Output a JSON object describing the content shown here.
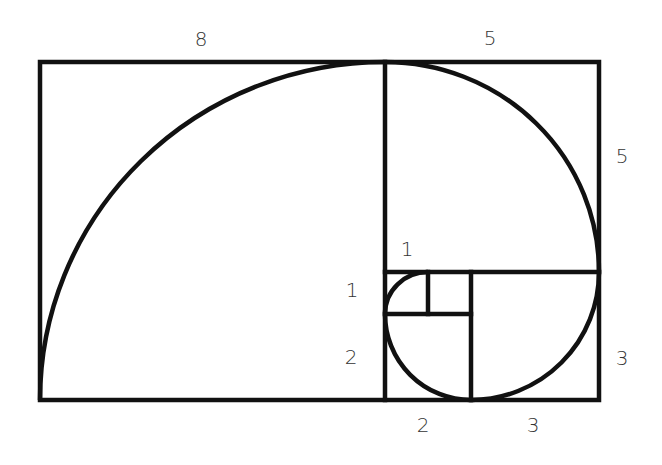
{
  "colors": {
    "stroke": "#111111",
    "label": "#333333",
    "background": "#ffffff"
  },
  "labels": {
    "top_8": "8",
    "top_5": "5",
    "right_5": "5",
    "right_3": "3",
    "inner_1_top": "1",
    "left_1": "1",
    "left_2": "2",
    "bottom_2": "2",
    "bottom_3": "3"
  },
  "squares": [
    {
      "side": 8,
      "label": "8"
    },
    {
      "side": 5,
      "label": "5"
    },
    {
      "side": 3,
      "label": "3"
    },
    {
      "side": 2,
      "label": "2"
    },
    {
      "side": 1,
      "label": "1"
    },
    {
      "side": 1,
      "label": "1"
    }
  ]
}
